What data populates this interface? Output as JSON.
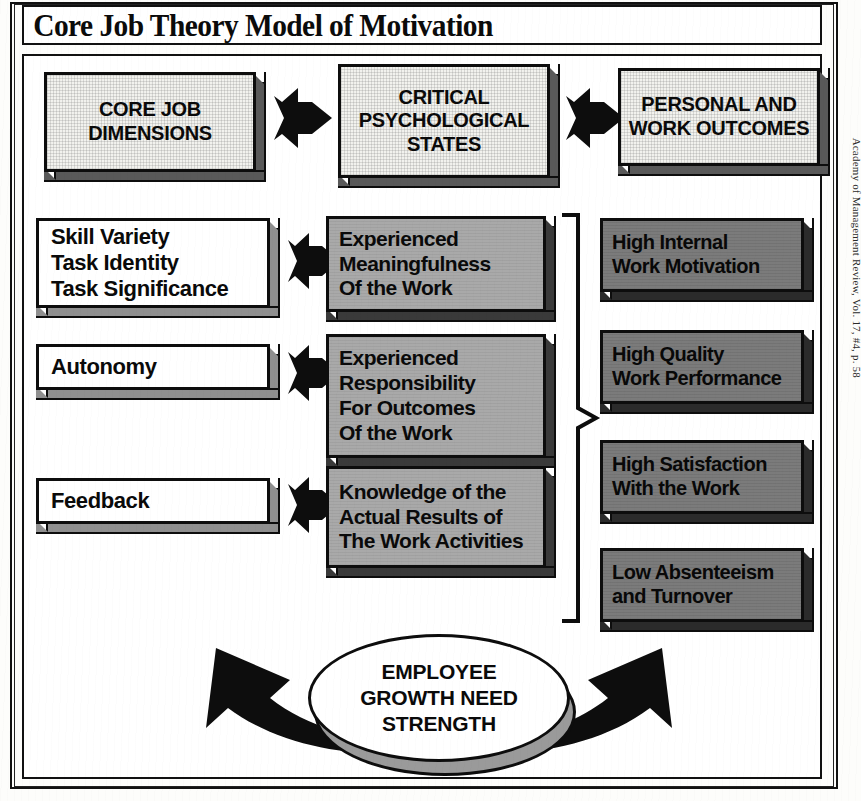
{
  "title": "Core Job Theory Model of Motivation",
  "headers": [
    {
      "label": "CORE JOB\nDIMENSIONS"
    },
    {
      "label": "CRITICAL\nPSYCHOLOGICAL\nSTATES"
    },
    {
      "label": "PERSONAL AND\nWORK OUTCOMES"
    }
  ],
  "core_job_dimensions": [
    {
      "label": "Skill Variety\nTask Identity\nTask Significance"
    },
    {
      "label": "Autonomy"
    },
    {
      "label": "Feedback"
    }
  ],
  "critical_psychological_states": [
    {
      "label": "Experienced\nMeaningfulness\nOf the Work"
    },
    {
      "label": "Experienced\nResponsibility\nFor Outcomes\nOf the Work"
    },
    {
      "label": "Knowledge of the\nActual Results of\nThe Work Activities"
    }
  ],
  "personal_and_work_outcomes": [
    {
      "label": "High Internal\nWork Motivation"
    },
    {
      "label": "High Quality\nWork Performance"
    },
    {
      "label": "High Satisfaction\nWith the Work"
    },
    {
      "label": "Low Absenteeism\nand Turnover"
    }
  ],
  "moderator": {
    "label": "EMPLOYEE\nGROWTH NEED\nSTRENGTH"
  },
  "credit": "Academy of Management Review, Vol. 17, #4, p. 58",
  "colors": {
    "ink": "#0d0d0d",
    "header_fill": "#f2f2ee",
    "left_fill": "#ffffff",
    "mid_fill": "#a9a9a9",
    "right_fill": "#7b7b7b",
    "shadow": "#3a3a3a",
    "page": "#ffffff"
  }
}
